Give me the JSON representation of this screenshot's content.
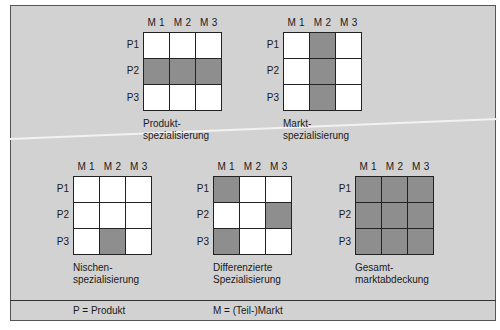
{
  "colors": {
    "background": "#d2d2d2",
    "filled": "#8e8e8e",
    "empty": "#ffffff",
    "line": "#222222"
  },
  "column_labels": [
    "M 1",
    "M 2",
    "M 3"
  ],
  "row_labels": [
    "P1",
    "P2",
    "P3"
  ],
  "matrices": [
    {
      "caption_line1": "Produkt-",
      "caption_line2": "spezialisierung",
      "cells": [
        [
          0,
          0,
          0
        ],
        [
          1,
          1,
          1
        ],
        [
          0,
          0,
          0
        ]
      ]
    },
    {
      "caption_line1": "Markt-",
      "caption_line2": "spezialisierung",
      "cells": [
        [
          0,
          1,
          0
        ],
        [
          0,
          1,
          0
        ],
        [
          0,
          1,
          0
        ]
      ]
    },
    {
      "caption_line1": "Nischen-",
      "caption_line2": "spezialisierung",
      "cells": [
        [
          0,
          0,
          0
        ],
        [
          0,
          0,
          0
        ],
        [
          0,
          1,
          0
        ]
      ]
    },
    {
      "caption_line1": "Differenzierte",
      "caption_line2": "Spezialisierung",
      "cells": [
        [
          1,
          0,
          0
        ],
        [
          0,
          0,
          1
        ],
        [
          1,
          0,
          0
        ]
      ]
    },
    {
      "caption_line1": "Gesamt-",
      "caption_line2": "marktabdeckung",
      "cells": [
        [
          1,
          1,
          1
        ],
        [
          1,
          1,
          1
        ],
        [
          1,
          1,
          1
        ]
      ]
    }
  ],
  "legend": {
    "product": "P = Produkt",
    "market": "M = (Teil-)Markt"
  }
}
